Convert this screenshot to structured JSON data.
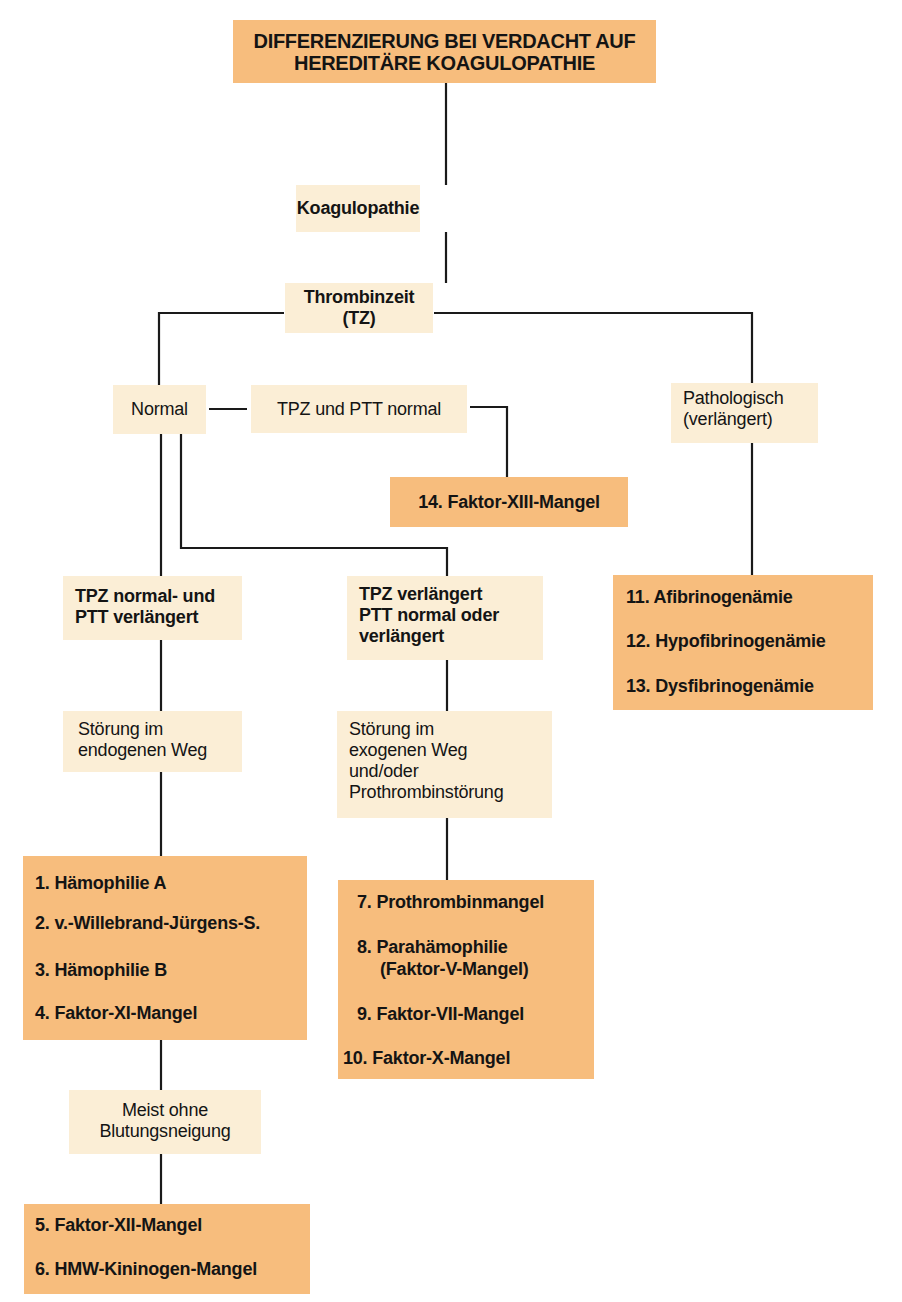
{
  "title": {
    "line1": "DIFFERENZIERUNG BEI VERDACHT AUF",
    "line2": "HEREDITÄRE KOAGULOPATHIE"
  },
  "nodes": {
    "koagulopathie": "Koagulopathie",
    "thrombinzeit": "Thrombinzeit (TZ)",
    "normal": "Normal",
    "tpz_ptt_normal": "TPZ und PTT normal",
    "pathologisch": {
      "line1": "Pathologisch",
      "line2": "(verlängert)"
    },
    "tpz_normal_ptt_verl": {
      "line1": "TPZ normal- und",
      "line2": "PTT verlängert"
    },
    "tpz_verl": {
      "line1": "TPZ verlängert",
      "line2": "PTT normal oder",
      "line3": "verlängert"
    },
    "stoerung_endogen": {
      "line1": "Störung im",
      "line2": "endogenen Weg"
    },
    "stoerung_exogen": {
      "line1": "Störung im",
      "line2": "exogenen Weg",
      "line3": "und/oder",
      "line4": "Prothrombinstörung"
    },
    "meist_ohne": {
      "line1": "Meist ohne",
      "line2": "Blutungsneigung"
    }
  },
  "outcomes": {
    "faktor_xiii": "14. Faktor-XIII-Mangel",
    "fibrinogen": [
      "11. Afibrinogenämie",
      "12. Hypofibrinogenämie",
      "13. Dysfibrinogenämie"
    ],
    "endogen": [
      "1. Hämophilie A",
      "2. v.-Willebrand-Jürgens-S.",
      "3. Hämophilie B",
      "4. Faktor-XI-Mangel"
    ],
    "exogen": [
      "7. Prothrombinmangel",
      "8. Parahämophilie",
      "(Faktor-V-Mangel)",
      "9. Faktor-VII-Mangel",
      "10. Faktor-X-Mangel"
    ],
    "kontakt": [
      "5. Faktor-XII-Mangel",
      "6. HMW-Kininogen-Mangel"
    ]
  },
  "colors": {
    "light_box": "#fbeed6",
    "dark_box": "#f7bd7d",
    "line": "#1a1a1a",
    "text": "#141414"
  }
}
